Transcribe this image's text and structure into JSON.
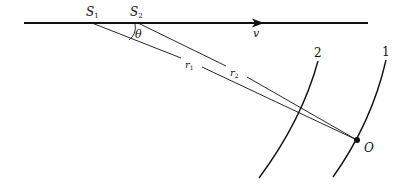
{
  "diagram": {
    "labels": {
      "source1": "S",
      "source1_sub": "1",
      "source2": "S",
      "source2_sub": "2",
      "angle": "θ",
      "velocity": "v",
      "dist1": "r",
      "dist1_sub": "1",
      "dist2": "r",
      "dist2_sub": "2",
      "wavefront1": "1",
      "wavefront2": "2",
      "observer": "O"
    },
    "colors": {
      "ink": "#111111",
      "background": "#ffffff"
    }
  }
}
